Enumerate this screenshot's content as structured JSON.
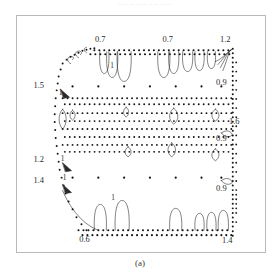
{
  "page": {
    "bleed_text": "..... ... ...... .. ... ......",
    "caption": "(a)"
  },
  "figure": {
    "frame": {
      "x": 16,
      "y": 15,
      "width": 250,
      "height": 238,
      "border_color": "#b9b9b9"
    },
    "background": "#ffffff",
    "ink_color": "#1a1a1a"
  },
  "chart_data": {
    "type": "scatter",
    "title": "",
    "subtitle": "",
    "xlabel": "",
    "ylabel": "",
    "grid": false,
    "legend": null,
    "axes_visible": false,
    "tick_labels": {
      "x": [],
      "y": []
    },
    "contour_levels": [
      0.6,
      0.7,
      0.9,
      1.0,
      1.2,
      1.4,
      1.5,
      1.6
    ],
    "annotations": [
      {
        "id": "top-left-07",
        "text": "0.7",
        "x": 100,
        "y": 41,
        "edge": "top"
      },
      {
        "id": "top-mid-07",
        "text": "0.7",
        "x": 168,
        "y": 41,
        "edge": "top"
      },
      {
        "id": "top-right-12",
        "text": "1.2",
        "x": 226,
        "y": 41,
        "edge": "top"
      },
      {
        "id": "left-upper-15",
        "text": "1.5",
        "x": 38,
        "y": 88,
        "edge": "left"
      },
      {
        "id": "left-upper-1",
        "text": "1",
        "x": 60,
        "y": 95,
        "edge": "left"
      },
      {
        "id": "left-mid-12",
        "text": "1.2",
        "x": 38,
        "y": 162,
        "edge": "left"
      },
      {
        "id": "left-mid-1",
        "text": "1",
        "x": 62,
        "y": 161,
        "edge": "left"
      },
      {
        "id": "left-lower-14",
        "text": "1.4",
        "x": 38,
        "y": 183,
        "edge": "left"
      },
      {
        "id": "left-lower-1",
        "text": "1",
        "x": 64,
        "y": 180,
        "edge": "left"
      },
      {
        "id": "right-upper-09",
        "text": "0.9",
        "x": 222,
        "y": 85,
        "edge": "right"
      },
      {
        "id": "right-mid-16",
        "text": "1.6",
        "x": 235,
        "y": 124,
        "edge": "right"
      },
      {
        "id": "right-lower-09",
        "text": "0.9",
        "x": 222,
        "y": 141,
        "edge": "right"
      },
      {
        "id": "right-bot-09",
        "text": "0.9",
        "x": 222,
        "y": 191,
        "edge": "right"
      },
      {
        "id": "top-inner-1",
        "text": "1",
        "x": 112,
        "y": 67,
        "edge": "interior"
      },
      {
        "id": "bot-inner-1",
        "text": "1",
        "x": 113,
        "y": 201,
        "edge": "interior"
      },
      {
        "id": "bot-left-06",
        "text": "0.6",
        "x": 84,
        "y": 243,
        "edge": "bottom"
      },
      {
        "id": "bot-right-14",
        "text": "1.4",
        "x": 228,
        "y": 244,
        "edge": "bottom"
      }
    ],
    "domain_outline": [
      [
        64,
        59
      ],
      [
        98,
        48
      ],
      [
        216,
        47
      ],
      [
        228,
        49
      ],
      [
        231,
        62
      ],
      [
        233,
        140
      ],
      [
        233,
        205
      ],
      [
        231,
        233
      ],
      [
        210,
        236
      ],
      [
        92,
        236
      ],
      [
        76,
        231
      ],
      [
        62,
        212
      ],
      [
        56,
        170
      ],
      [
        54,
        120
      ],
      [
        58,
        78
      ]
    ],
    "boundary_dot_rows_y": [
      49,
      53,
      98,
      104,
      113,
      121,
      129,
      137,
      145,
      152,
      231,
      236
    ],
    "interior_sparse_rows_y": [
      86,
      178
    ],
    "interior_sparse_cols_x": [
      72,
      98,
      124,
      150,
      176,
      202,
      222
    ]
  }
}
